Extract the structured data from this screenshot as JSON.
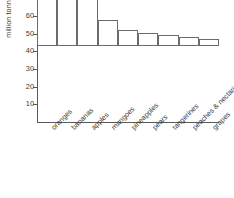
{
  "chart_data": {
    "type": "bar",
    "title": "",
    "subtitle": "",
    "xlabel": "",
    "ylabel": "million tonnes",
    "ylim": [
      0,
      60
    ],
    "yticks": [
      10,
      20,
      30,
      40,
      50,
      60
    ],
    "grid": false,
    "legend": null,
    "bar_fill_color": "#ffffff",
    "bar_outline_color": "#6b6b6b",
    "axis_color": "#5a5a5a",
    "categories": [
      "oranges",
      "bananas",
      "apples",
      "mangoes",
      "pineapples",
      "pears",
      "tangerines",
      "peaches & nectarines",
      "grapes"
    ],
    "values": [
      55,
      45,
      38,
      14.5,
      9,
      7.5,
      6.5,
      5,
      4
    ],
    "units": "million tonnes"
  },
  "axis": {
    "y_title": "million tonnes",
    "tick_labels": [
      "60",
      "50",
      "40",
      "30",
      "20",
      "10"
    ]
  }
}
